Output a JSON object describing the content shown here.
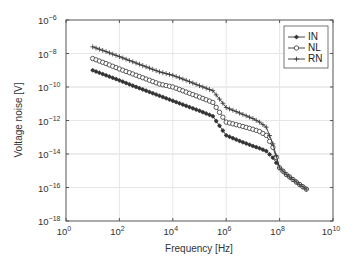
{
  "chart_data": {
    "type": "line",
    "title": "",
    "xlabel": "Frequency [Hz]",
    "ylabel": "Voltage noise [V]",
    "xscale": "log",
    "yscale": "log",
    "xlim": [
      1,
      10000000000
    ],
    "ylim": [
      1e-18,
      1e-06
    ],
    "grid": true,
    "legend_position": "upper right",
    "x_ticks": [
      {
        "base": "10",
        "exp": "0"
      },
      {
        "base": "10",
        "exp": "2"
      },
      {
        "base": "10",
        "exp": "4"
      },
      {
        "base": "10",
        "exp": "6"
      },
      {
        "base": "10",
        "exp": "8"
      },
      {
        "base": "10",
        "exp": "10"
      }
    ],
    "y_ticks": [
      {
        "base": "10",
        "exp": "−6"
      },
      {
        "base": "10",
        "exp": "−8"
      },
      {
        "base": "10",
        "exp": "−10"
      },
      {
        "base": "10",
        "exp": "−12"
      },
      {
        "base": "10",
        "exp": "−14"
      },
      {
        "base": "10",
        "exp": "−16"
      },
      {
        "base": "10",
        "exp": "−18"
      }
    ],
    "series": [
      {
        "name": "IN",
        "marker": "asterisk",
        "log10_x": [
          1,
          1.5,
          2,
          2.5,
          3,
          3.5,
          4,
          4.5,
          5,
          5.5,
          6,
          6.5,
          7,
          7.25,
          7.5,
          7.75,
          8,
          8.25,
          8.5,
          8.75,
          9
        ],
        "values": [
          1e-09,
          5e-10,
          2.5e-10,
          1.2e-10,
          6e-11,
          3e-11,
          1.5e-11,
          7.5e-12,
          3.8e-12,
          1.8e-12,
          1.3e-13,
          6e-14,
          3e-14,
          2.2e-14,
          1.5e-14,
          6e-15,
          1.5e-15,
          6e-16,
          3e-16,
          1.5e-16,
          8e-17
        ]
      },
      {
        "name": "NL",
        "marker": "circle",
        "log10_x": [
          1,
          1.5,
          2,
          2.5,
          3,
          3.5,
          4,
          4.5,
          5,
          5.5,
          6,
          6.5,
          7,
          7.25,
          7.5,
          7.75,
          8,
          8.25,
          8.5,
          8.75,
          9
        ],
        "values": [
          5e-09,
          2.5e-09,
          1.2e-09,
          6e-10,
          3e-10,
          1.5e-10,
          1e-10,
          5e-11,
          2.5e-11,
          1.2e-11,
          8e-13,
          5e-13,
          3e-13,
          2.2e-13,
          1.3e-13,
          2.5e-14,
          1.5e-15,
          6e-16,
          3e-16,
          1.5e-16,
          8e-17
        ]
      },
      {
        "name": "RN",
        "marker": "plus",
        "log10_x": [
          1,
          1.5,
          2,
          2.5,
          3,
          3.5,
          4,
          4.5,
          5,
          5.5,
          6,
          6.5,
          7,
          7.25,
          7.5,
          7.75,
          8,
          8.25,
          8.5,
          8.75,
          9
        ],
        "values": [
          2.5e-08,
          1.3e-08,
          6.5e-09,
          3.2e-09,
          1.6e-09,
          8e-10,
          5e-10,
          2.5e-10,
          1.2e-10,
          6e-11,
          6e-12,
          2.8e-12,
          1.3e-12,
          8e-13,
          4e-13,
          4e-14,
          1.5e-15,
          6e-16,
          3e-16,
          1.5e-16,
          8e-17
        ]
      }
    ]
  },
  "legend": {
    "items": [
      {
        "label": "IN",
        "marker": "asterisk-icon"
      },
      {
        "label": "NL",
        "marker": "circle-icon"
      },
      {
        "label": "RN",
        "marker": "plus-icon"
      }
    ]
  },
  "colors": {
    "line": "#333333",
    "axis": "#555555",
    "grid": "#e6e6e6",
    "background": "#ffffff"
  }
}
